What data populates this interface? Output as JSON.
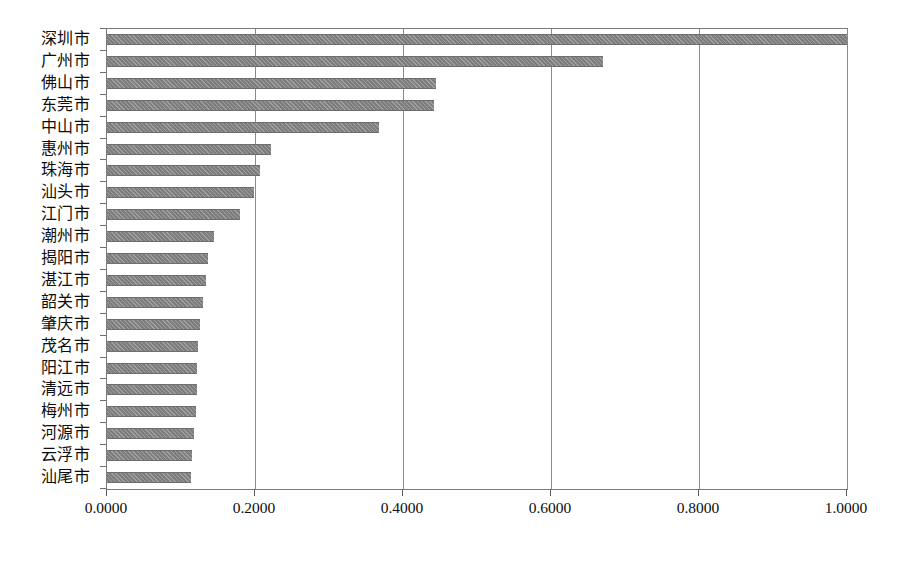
{
  "chart_data": {
    "type": "bar",
    "orientation": "horizontal",
    "title": "",
    "subtitle": "",
    "xlabel": "",
    "ylabel": "",
    "xlim": [
      0.0,
      1.0
    ],
    "grid": true,
    "legend": false,
    "legend_position": "none",
    "bar_color": "#7d7d7d",
    "bar_pattern": "hatched",
    "xticks": [
      0.0,
      0.2,
      0.4,
      0.6,
      0.8,
      1.0
    ],
    "xticklabels": [
      "0.0000",
      "0.2000",
      "0.4000",
      "0.6000",
      "0.8000",
      "1.0000"
    ],
    "categories": [
      "深圳市",
      "广州市",
      "佛山市",
      "东莞市",
      "中山市",
      "惠州市",
      "珠海市",
      "汕头市",
      "江门市",
      "潮州市",
      "揭阳市",
      "湛江市",
      "韶关市",
      "肇庆市",
      "茂名市",
      "阳江市",
      "清远市",
      "梅州市",
      "河源市",
      "云浮市",
      "汕尾市"
    ],
    "values": [
      1.0,
      0.67,
      0.445,
      0.442,
      0.368,
      0.222,
      0.207,
      0.199,
      0.18,
      0.145,
      0.137,
      0.134,
      0.13,
      0.125,
      0.123,
      0.122,
      0.121,
      0.12,
      0.118,
      0.115,
      0.113
    ]
  }
}
